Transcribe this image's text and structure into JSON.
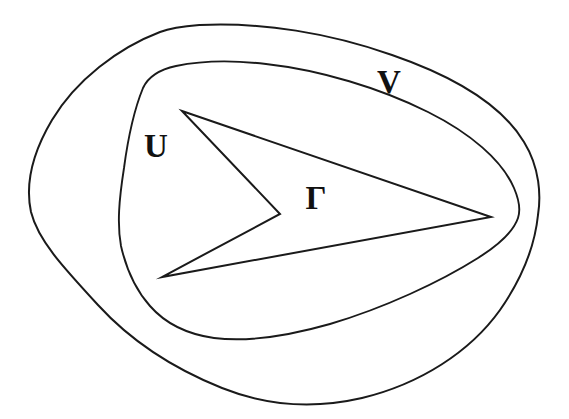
{
  "figure": {
    "kind": "line-drawing-diagram",
    "background_color": "#ffffff",
    "stroke_color": "#1a1a1a",
    "width": 569,
    "height": 419
  },
  "labels": [
    {
      "id": "label-u",
      "text": "U",
      "x": 156,
      "y": 157,
      "font_size": 33
    },
    {
      "id": "label-v",
      "text": "V",
      "x": 389,
      "y": 93,
      "font_size": 33
    },
    {
      "id": "label-gamma",
      "text": "Γ",
      "x": 316,
      "y": 209,
      "font_size": 33
    }
  ],
  "shapes": {
    "outer_curve": {
      "name": "V",
      "closed": true,
      "path": "M 200 25 C 262 22 330 33 392 55 C 450 75 500 102 524 142 C 540 168 541 196 538 215 C 535 244 523 277 500 310 C 470 352 420 384 362 398 C 310 410 262 404 222 388 C 172 368 130 340 98 305 C 62 266 38 240 31 212 C 25 184 33 152 52 120 C 76 80 118 48 160 32 C 173 27 187 26 200 25 Z"
    },
    "middle_curve": {
      "name": "U",
      "closed": true,
      "path": "M 176 66 C 200 61 232 60 266 64 C 320 70 380 88 428 112 C 470 133 502 160 514 188 C 520 202 520 212 518 218 C 514 230 500 244 478 258 C 440 282 384 308 330 324 C 288 336 246 342 214 338 C 186 334 164 322 150 306 C 134 288 126 268 121 246 C 117 224 119 200 124 168 C 128 138 134 110 143 88 C 149 75 162 69 176 66 Z"
    },
    "inner_curve": {
      "name": "Γ",
      "closed": true,
      "path": "M 182 111 L 491 217 L 162 277 L 280 214 Z",
      "vertices": [
        {
          "x": 182,
          "y": 111,
          "role": "top-left-tip"
        },
        {
          "x": 491,
          "y": 217,
          "role": "right-tip"
        },
        {
          "x": 162,
          "y": 277,
          "role": "bottom-left-tip"
        },
        {
          "x": 280,
          "y": 214,
          "role": "concave-notch"
        }
      ]
    }
  }
}
